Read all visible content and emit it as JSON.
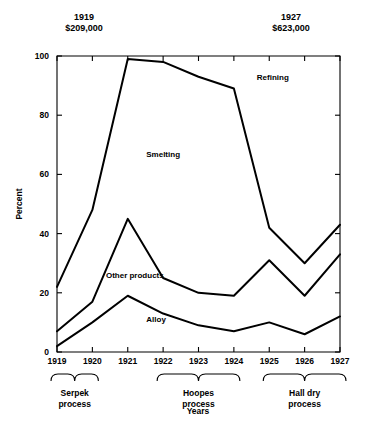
{
  "header": {
    "left": "1919\n$209,000",
    "right": "1927\n$623,000"
  },
  "chart_data": {
    "type": "line",
    "title": "",
    "xlabel": "Years",
    "ylabel": "Percent",
    "ylim": [
      0,
      100
    ],
    "yticks": [
      0,
      20,
      40,
      60,
      80,
      100
    ],
    "grid": false,
    "legend": "inline-annotations",
    "categories": [
      "1919",
      "1920",
      "1921",
      "1922",
      "1923",
      "1924",
      "1925",
      "1926",
      "1927"
    ],
    "series": [
      {
        "name": "Smelting",
        "values": [
          22,
          48,
          99,
          98,
          93,
          89,
          42,
          30,
          43
        ]
      },
      {
        "name": "Other products",
        "values": [
          7,
          17,
          45,
          25,
          20,
          19,
          31,
          19,
          33
        ]
      },
      {
        "name": "Alloy",
        "values": [
          2,
          10,
          19,
          13,
          9,
          7,
          10,
          6,
          12
        ]
      }
    ],
    "annotations": [
      {
        "text": "Refining",
        "x": 1925.1,
        "y": 92
      },
      {
        "text": "Smelting",
        "x": 1922.0,
        "y": 66
      },
      {
        "text": "Other products",
        "x": 1921.2,
        "y": 25
      },
      {
        "text": "Alloy",
        "x": 1921.8,
        "y": 10
      }
    ],
    "x_groups": [
      {
        "label": "Serpek\nprocess",
        "from": "1919",
        "to": "1920"
      },
      {
        "label": "Hoopes\nprocess",
        "from": "1922",
        "to": "1924"
      },
      {
        "label": "Hall dry\nprocess",
        "from": "1925",
        "to": "1927"
      }
    ]
  }
}
